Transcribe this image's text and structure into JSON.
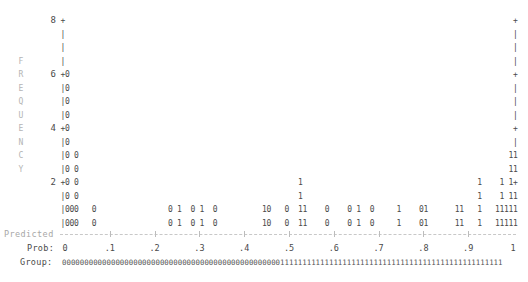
{
  "chart_data": {
    "type": "bar",
    "title": "",
    "xlabel": "Predicted Prob",
    "ylabel": "FREQUENCY",
    "x_axis_label_rows": [
      "Predicted",
      "Prob:",
      "Group:"
    ],
    "xticks": [
      "0",
      ".1",
      ".2",
      ".3",
      ".4",
      ".5",
      ".6",
      ".7",
      ".8",
      ".9",
      "1"
    ],
    "yticks": [
      "8",
      "6",
      "4",
      "2"
    ],
    "ylim": [
      0,
      8
    ],
    "xlim": [
      0,
      1
    ],
    "grid": false,
    "legend": null,
    "series": [
      {
        "name": "Outcome 0",
        "symbol": "0",
        "points": [
          {
            "prob": 0.0,
            "freq": 6
          },
          {
            "prob": 0.01,
            "freq": 1
          },
          {
            "prob": 0.02,
            "freq": 2
          },
          {
            "prob": 0.06,
            "freq": 1
          },
          {
            "prob": 0.23,
            "freq": 1
          },
          {
            "prob": 0.28,
            "freq": 1
          },
          {
            "prob": 0.33,
            "freq": 1
          },
          {
            "prob": 0.45,
            "freq": 1
          },
          {
            "prob": 0.49,
            "freq": 1
          },
          {
            "prob": 0.58,
            "freq": 1
          },
          {
            "prob": 0.63,
            "freq": 1
          },
          {
            "prob": 0.68,
            "freq": 1
          },
          {
            "prob": 0.79,
            "freq": 1
          }
        ]
      },
      {
        "name": "Outcome 1",
        "symbol": "1",
        "points": [
          {
            "prob": 0.25,
            "freq": 1
          },
          {
            "prob": 0.3,
            "freq": 1
          },
          {
            "prob": 0.44,
            "freq": 1
          },
          {
            "prob": 0.52,
            "freq": 2
          },
          {
            "prob": 0.53,
            "freq": 1
          },
          {
            "prob": 0.65,
            "freq": 1
          },
          {
            "prob": 0.74,
            "freq": 1
          },
          {
            "prob": 0.8,
            "freq": 1
          },
          {
            "prob": 0.87,
            "freq": 1
          },
          {
            "prob": 0.88,
            "freq": 1
          },
          {
            "prob": 0.92,
            "freq": 2
          },
          {
            "prob": 0.96,
            "freq": 1
          },
          {
            "prob": 0.97,
            "freq": 2
          },
          {
            "prob": 0.98,
            "freq": 1
          },
          {
            "prob": 0.99,
            "freq": 3
          },
          {
            "prob": 1.0,
            "freq": 3
          }
        ]
      }
    ]
  },
  "plot": {
    "ylabel_letters": [
      "F",
      "R",
      "E",
      "Q",
      "U",
      "E",
      "N",
      "C",
      "Y"
    ],
    "ytick_labels": [
      {
        "row": 0,
        "label": "8"
      },
      {
        "row": 4,
        "label": "6"
      },
      {
        "row": 8,
        "label": "4"
      },
      {
        "row": 12,
        "label": "2"
      }
    ],
    "rows": [
      "+                                                                                                    +",
      "|                                                                                                    |",
      "|                                                                                                    |",
      "|                                                                                                    |",
      "+0                                                                                                   +",
      "|0                                                                                                   |",
      "|0                                                                                                   |",
      "|0                                                                                                   |",
      "+0                                                                                                   +",
      "|0                                                                                                   |",
      "|0 0                                                                                                11",
      "|0 0                                                                                                11",
      "+0 0                                                 1                                       1    1 1+",
      "|0 0                                                 1                                       1    1 11",
      "|000   0                0 1  0 1  0          10   0  11    0    0 1  0     1    01      11   1   11111",
      "|000   0                0 1  0 1  0          10   0  11    0    0 1  0     1    01      11   1   11111"
    ],
    "predicted_label": "Predicted",
    "prob_label": "Prob:",
    "group_label": "Group:",
    "prob_ticks": [
      "0",
      ".1",
      ".2",
      ".3",
      ".4",
      ".5",
      ".6",
      ".7",
      ".8",
      ".9",
      "1"
    ],
    "group_string": "000000000000000000000000000000000000000000000000011111111111111111111111111111111111111111111111111"
  }
}
